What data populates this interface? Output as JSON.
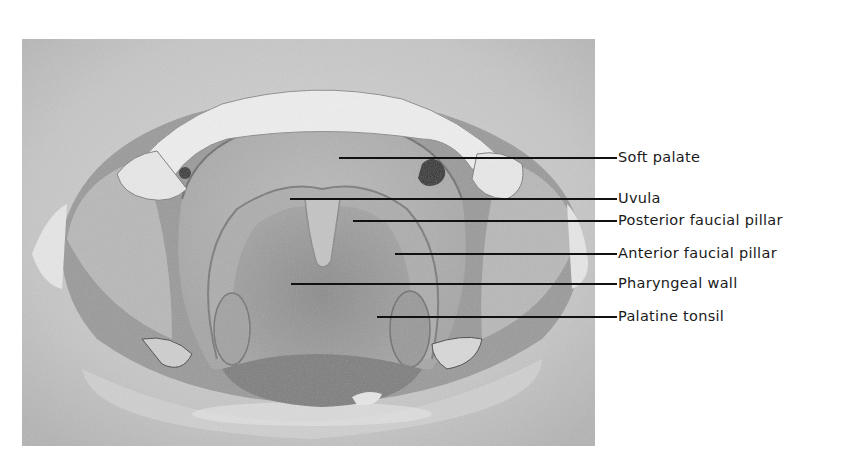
{
  "figure": {
    "type": "anatomical-photo-with-labels",
    "image_box": {
      "x": 22,
      "y": 39,
      "width": 573,
      "height": 407
    },
    "label_text_x": 618,
    "leader_end_x": 617,
    "colors": {
      "background": "#ffffff",
      "line": "#111111",
      "text": "#1a1a1a"
    },
    "labels": [
      {
        "text": "Soft palate",
        "y": 158,
        "pointer_x": 339
      },
      {
        "text": "Uvula",
        "y": 199,
        "pointer_x": 290
      },
      {
        "text": "Posterior faucial pillar",
        "y": 221,
        "pointer_x": 353
      },
      {
        "text": "Anterior faucial pillar",
        "y": 254,
        "pointer_x": 395
      },
      {
        "text": "Pharyngeal wall",
        "y": 284,
        "pointer_x": 291
      },
      {
        "text": "Palatine tonsil",
        "y": 317,
        "pointer_x": 377
      }
    ]
  }
}
